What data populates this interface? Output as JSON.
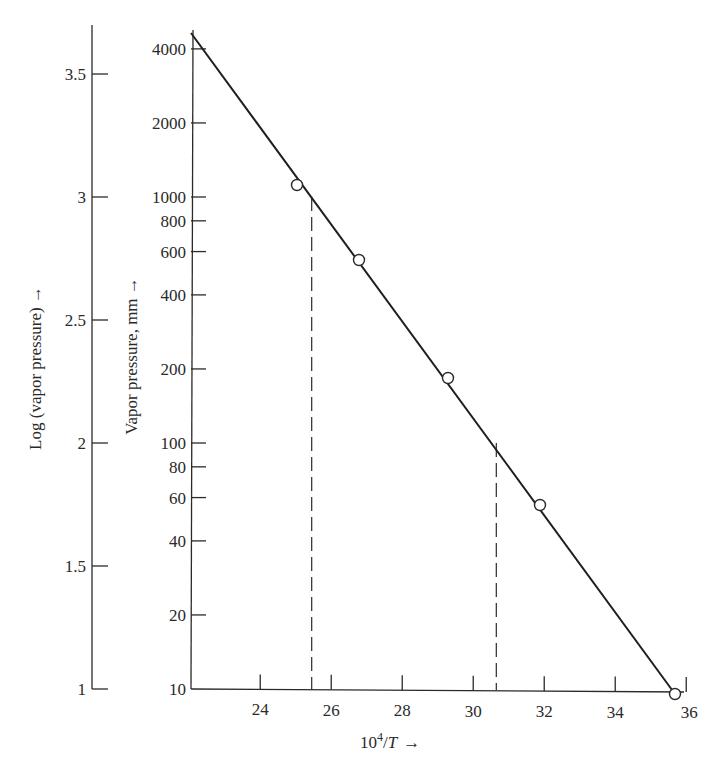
{
  "chart_data": {
    "type": "scatter",
    "title": "",
    "xlabel": "10^4/T",
    "xlabel_display": {
      "base": "10",
      "sup": "4",
      "rest": "/",
      "italic": "T",
      "arrow": "→"
    },
    "ylabel": "Vapor pressure, mm",
    "ylabel_display": "Vapor pressure, mm →",
    "ylabel_secondary": "Log (vapor pressure)",
    "ylabel_secondary_display": "Log (vapor pressure) →",
    "yscale": "log",
    "xlim": [
      22,
      36
    ],
    "ylim": [
      10,
      4500
    ],
    "grid": false,
    "legend": null,
    "x_ticks": [
      "24",
      "26",
      "28",
      "30",
      "32",
      "34",
      "36"
    ],
    "y_ticks": [
      "10",
      "20",
      "40",
      "60",
      "80",
      "100",
      "200",
      "400",
      "600",
      "800",
      "1000",
      "2000",
      "4000"
    ],
    "y_secondary_ticks": [
      "1",
      "1.5",
      "2",
      "2.5",
      "3",
      "3.5"
    ],
    "series": [
      {
        "name": "measured points",
        "marker": "open-circle",
        "x": [
          25.1,
          26.8,
          29.3,
          31.9,
          35.7
        ],
        "y": [
          1120,
          560,
          185,
          56,
          9.5
        ]
      },
      {
        "name": "fitted line",
        "style": "solid-line",
        "x": [
          22.0,
          35.7
        ],
        "y": [
          4500,
          9.5
        ]
      }
    ],
    "annotations": [
      {
        "type": "dashed-vertical",
        "x": 25.45,
        "y_top": 1000,
        "y_bottom": 10
      },
      {
        "type": "dashed-vertical",
        "x": 30.65,
        "y_top": 100,
        "y_bottom": 10
      }
    ]
  }
}
